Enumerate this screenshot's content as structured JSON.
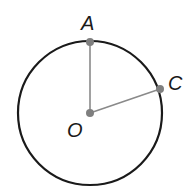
{
  "diagram": {
    "type": "circle-geometry",
    "circle": {
      "center": "O",
      "cx": 90,
      "cy": 113,
      "r": 72,
      "stroke": "#1a1a1a"
    },
    "points": [
      {
        "name": "A",
        "x": 90,
        "y": 42,
        "label_x": 82,
        "label_y": 28
      },
      {
        "name": "C",
        "x": 160,
        "y": 89,
        "label_x": 170,
        "label_y": 90
      },
      {
        "name": "O",
        "x": 90,
        "y": 113,
        "label_x": 69,
        "label_y": 136
      }
    ],
    "segments": [
      {
        "from": "O",
        "to": "A",
        "stroke": "#8a8a8a"
      },
      {
        "from": "O",
        "to": "C",
        "stroke": "#8a8a8a"
      }
    ],
    "point_color": "#7f7f7f"
  },
  "labels": {
    "A": "A",
    "C": "C",
    "O": "O"
  }
}
